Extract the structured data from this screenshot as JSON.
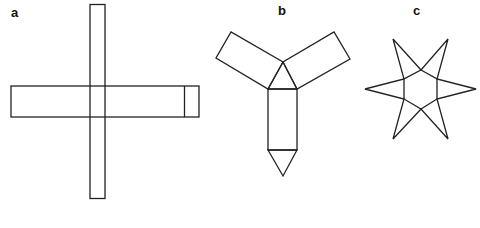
{
  "panels": [
    {
      "id": "a",
      "label": "a",
      "description": "Cross-shaped net: a long vertical strip crossing a long horizontal strip, horizontal strip has an extra end segment on the right"
    },
    {
      "id": "b",
      "label": "b",
      "description": "Three-armed net: central triangle with two rectangles angled up-left and up-right, a rectangle below ending in a triangular point"
    },
    {
      "id": "c",
      "label": "c",
      "description": "Six-pointed star: central hexagon with six triangular points"
    }
  ],
  "colors": {
    "stroke": "#222222",
    "background": "#ffffff"
  }
}
